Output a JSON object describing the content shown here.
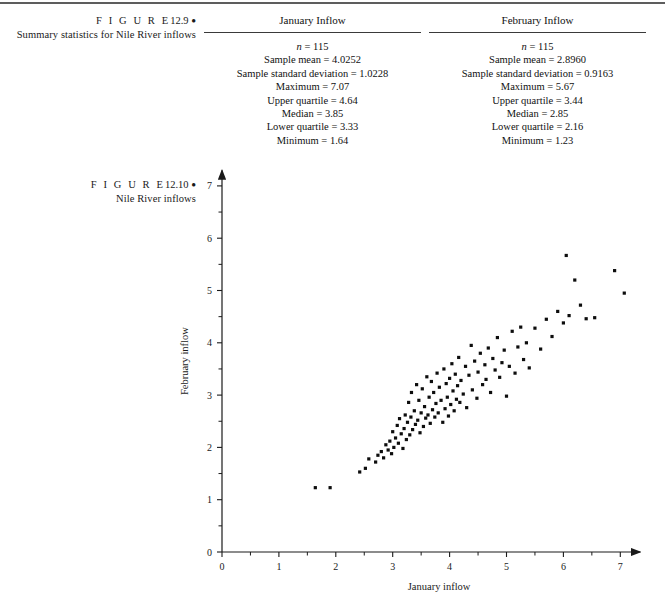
{
  "page": {
    "top_rule": true
  },
  "figure_129": {
    "label": "F I G U R E",
    "number": "12.9",
    "bullet": "●",
    "title": "Summary statistics for Nile River inflows",
    "columns": [
      {
        "header": "January Inflow",
        "rows": [
          {
            "prefix": "n",
            "italic_prefix": true,
            "text": " = 115"
          },
          {
            "prefix": "Sample mean",
            "italic_prefix": false,
            "text": " = 4.0252"
          },
          {
            "prefix": "Sample standard deviation",
            "italic_prefix": false,
            "text": " = 1.0228"
          },
          {
            "prefix": "Maximum",
            "italic_prefix": false,
            "text": " = 7.07"
          },
          {
            "prefix": "Upper quartile",
            "italic_prefix": false,
            "text": " = 4.64"
          },
          {
            "prefix": "Median",
            "italic_prefix": false,
            "text": " = 3.85"
          },
          {
            "prefix": "Lower quartile",
            "italic_prefix": false,
            "text": " = 3.33"
          },
          {
            "prefix": "Minimum",
            "italic_prefix": false,
            "text": " = 1.64"
          }
        ]
      },
      {
        "header": "February Inflow",
        "rows": [
          {
            "prefix": "n",
            "italic_prefix": true,
            "text": " = 115"
          },
          {
            "prefix": "Sample mean",
            "italic_prefix": false,
            "text": " = 2.8960"
          },
          {
            "prefix": "Sample standard deviation",
            "italic_prefix": false,
            "text": " = 0.9163"
          },
          {
            "prefix": "Maximum",
            "italic_prefix": false,
            "text": " = 5.67"
          },
          {
            "prefix": "Upper quartile",
            "italic_prefix": false,
            "text": " = 3.44"
          },
          {
            "prefix": "Median",
            "italic_prefix": false,
            "text": " = 2.85"
          },
          {
            "prefix": "Lower quartile",
            "italic_prefix": false,
            "text": " = 2.16"
          },
          {
            "prefix": "Minimum",
            "italic_prefix": false,
            "text": " = 1.23"
          }
        ]
      }
    ]
  },
  "figure_1210": {
    "label": "F I G U R E",
    "number": "12.10",
    "bullet": "●",
    "title": "Nile River inflows"
  },
  "chart_data": {
    "type": "scatter",
    "title": "Nile River inflows",
    "xlabel": "January inflow",
    "ylabel": "February inflow",
    "xlim": [
      0,
      7.35
    ],
    "ylim": [
      0,
      7.3
    ],
    "xticks": [
      0,
      1,
      2,
      3,
      4,
      5,
      6,
      7
    ],
    "yticks": [
      0,
      1,
      2,
      3,
      4,
      5,
      6,
      7
    ],
    "xminor_step": 0.5,
    "yminor_step": 0.5,
    "grid": false,
    "legend": null,
    "marker": "square",
    "marker_color": "#0d0d0d",
    "marker_size_px": 3.2,
    "n": 115,
    "x": [
      1.64,
      1.9,
      2.42,
      2.52,
      2.58,
      2.7,
      2.74,
      2.8,
      2.84,
      2.88,
      2.92,
      2.95,
      2.98,
      3.0,
      3.02,
      3.05,
      3.08,
      3.1,
      3.12,
      3.15,
      3.18,
      3.2,
      3.22,
      3.24,
      3.26,
      3.28,
      3.3,
      3.32,
      3.33,
      3.35,
      3.38,
      3.4,
      3.42,
      3.44,
      3.46,
      3.48,
      3.5,
      3.52,
      3.54,
      3.56,
      3.58,
      3.6,
      3.62,
      3.64,
      3.66,
      3.68,
      3.7,
      3.72,
      3.74,
      3.76,
      3.78,
      3.8,
      3.82,
      3.85,
      3.88,
      3.9,
      3.92,
      3.94,
      3.96,
      3.98,
      4.0,
      4.02,
      4.04,
      4.06,
      4.08,
      4.1,
      4.12,
      4.14,
      4.16,
      4.18,
      4.2,
      4.24,
      4.28,
      4.3,
      4.34,
      4.38,
      4.4,
      4.44,
      4.48,
      4.5,
      4.54,
      4.58,
      4.62,
      4.64,
      4.68,
      4.72,
      4.76,
      4.8,
      4.84,
      4.88,
      4.92,
      4.96,
      5.0,
      5.05,
      5.1,
      5.15,
      5.2,
      5.25,
      5.3,
      5.35,
      5.4,
      5.5,
      5.6,
      5.7,
      5.8,
      5.9,
      6.0,
      6.05,
      6.1,
      6.2,
      6.3,
      6.4,
      6.55,
      6.9,
      7.07
    ],
    "y": [
      1.23,
      1.23,
      1.53,
      1.6,
      1.78,
      1.72,
      1.85,
      1.92,
      1.8,
      2.05,
      1.95,
      2.12,
      1.88,
      2.3,
      2.0,
      2.18,
      2.42,
      2.08,
      2.55,
      2.26,
      1.98,
      2.36,
      2.62,
      2.15,
      2.48,
      2.86,
      2.24,
      2.58,
      3.05,
      2.34,
      2.7,
      2.44,
      3.2,
      2.52,
      2.9,
      2.28,
      2.66,
      3.12,
      2.4,
      2.78,
      2.56,
      3.35,
      2.62,
      2.96,
      2.46,
      3.26,
      2.72,
      3.05,
      2.58,
      2.84,
      3.42,
      2.66,
      3.15,
      2.9,
      2.48,
      3.5,
      2.74,
      3.22,
      2.96,
      2.6,
      3.32,
      2.82,
      3.6,
      3.08,
      2.7,
      3.4,
      2.92,
      3.18,
      3.72,
      2.86,
      3.28,
      3.02,
      3.55,
      2.76,
      3.38,
      3.95,
      3.1,
      3.65,
      2.94,
      3.44,
      3.8,
      3.2,
      3.58,
      3.3,
      3.9,
      3.05,
      3.7,
      3.48,
      4.1,
      3.34,
      3.62,
      3.86,
      2.98,
      3.55,
      4.22,
      3.42,
      3.92,
      4.3,
      3.68,
      4.0,
      3.52,
      4.28,
      3.88,
      4.45,
      4.12,
      4.6,
      4.38,
      5.67,
      4.52,
      5.2,
      4.72,
      4.46,
      4.48,
      5.38,
      4.95
    ]
  }
}
